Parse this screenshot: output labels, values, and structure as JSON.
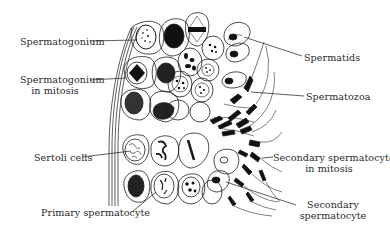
{
  "figure": {
    "labels": {
      "spermatogonium": "Spermatogonium",
      "spermatogonium_mitosis_1": "Spermatogonium",
      "spermatogonium_mitosis_2": "in mitosis",
      "sertoli": "Sertoli cells",
      "primary_spermatocyte": "Primary spermatocyte",
      "spermatids": "Spermatids",
      "spermatozoa": "Spermatozoa",
      "secondary_mitosis_1": "Secondary spermatocyte",
      "secondary_mitosis_2": "in mitosis",
      "secondary_1": "Secondary",
      "secondary_2": "spermatocyte"
    },
    "colors": {
      "ink": "#1a1a1a",
      "text": "#2a2a2a",
      "background": "#ffffff"
    }
  }
}
